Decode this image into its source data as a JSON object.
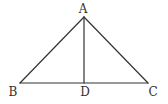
{
  "figure": {
    "type": "triangle-with-altitude",
    "stroke_color": "#333333",
    "background": "#ffffff",
    "points": {
      "A": {
        "label": "A",
        "x": 84,
        "y": 17,
        "label_x": 83,
        "label_y": 13
      },
      "B": {
        "label": "B",
        "x": 20,
        "y": 83,
        "label_x": 13,
        "label_y": 96
      },
      "C": {
        "label": "C",
        "x": 148,
        "y": 83,
        "label_x": 153,
        "label_y": 96
      },
      "D": {
        "label": "D",
        "x": 84,
        "y": 83,
        "label_x": 85,
        "label_y": 96
      }
    },
    "segments": [
      {
        "from": "A",
        "to": "B"
      },
      {
        "from": "A",
        "to": "C"
      },
      {
        "from": "B",
        "to": "C"
      },
      {
        "from": "A",
        "to": "D"
      }
    ]
  }
}
